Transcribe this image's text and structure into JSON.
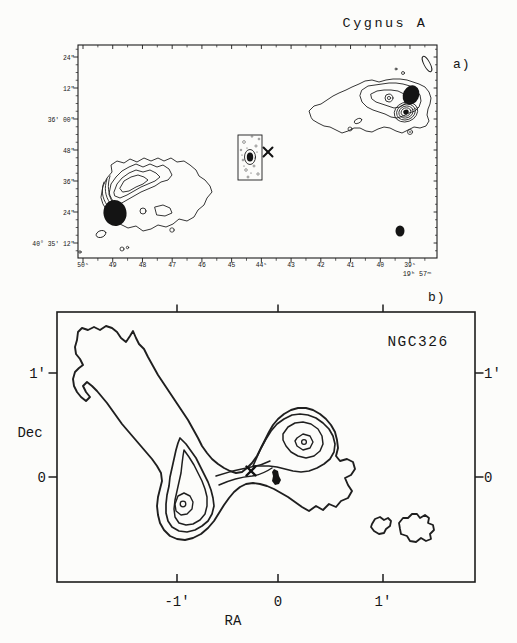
{
  "panel_a": {
    "label": "a)",
    "title": "Cygnus A",
    "dec_tick_labels": [
      "24\"",
      "12\"",
      "36' 00\"",
      "48\"",
      "36\"",
      "24\"",
      "40° 35' 12\""
    ],
    "ra_tick_labels": [
      "50ˢ",
      "49",
      "48",
      "47",
      "46",
      "45",
      "44ˢ",
      "43",
      "42",
      "41",
      "40",
      "39ˢ"
    ],
    "ra_axis_corner_label": "19ʰ 57ᵐ"
  },
  "panel_b": {
    "label": "b)",
    "title": "NGC326",
    "dec_axis_title": "Dec",
    "ra_axis_title": "RA",
    "left_tick_labels": [
      "1'",
      "0"
    ],
    "right_tick_labels": [
      "1'",
      "0"
    ],
    "bottom_tick_labels": [
      "-1'",
      "0",
      "1'"
    ]
  },
  "chart_data": [
    {
      "type": "contour",
      "panel": "a",
      "title": "Cygnus A",
      "x_axis": {
        "label": "19ʰ 57ᵐ (RA)",
        "ticks": [
          "50ˢ",
          "49",
          "48",
          "47",
          "46",
          "45",
          "44ˢ",
          "43",
          "42",
          "41",
          "40",
          "39ˢ"
        ],
        "direction": "RA increases to the left"
      },
      "y_axis": {
        "label": "Declination",
        "ticks": [
          "24\"",
          "12\"",
          "36' 00\"",
          "48\"",
          "36\"",
          "24\"",
          "40° 35' 12\""
        ]
      },
      "features": [
        "east radio lobe with filled hotspot and nested contours",
        "west radio lobe with filled hotspot and concentric secondary hotspot rings",
        "central core inside small rectangular inset with speckle noise",
        "X marker beside inset",
        "small filled beam ellipse at lower right"
      ]
    },
    {
      "type": "contour",
      "panel": "b",
      "title": "NGC326",
      "x_axis": {
        "label": "RA",
        "ticks": [
          "-1'",
          "0",
          "1'"
        ],
        "range_arcmin": [
          -2,
          2
        ]
      },
      "y_axis": {
        "label": "Dec",
        "ticks": [
          "1'",
          "0"
        ],
        "range_arcmin": [
          -1.5,
          1.5
        ]
      },
      "features": [
        "Z-shaped (inversion-symmetric) radio source outer contour with NE plume",
        "southeast lobe with 4 nested contour levels and peak near (-1', -0.3')",
        "northwest lobe with 4 nested contour levels and peak near (0.25', 0.25')",
        "filled radio core near (0,0) with X marker to its west",
        "two detached contour blobs at southwest"
      ]
    }
  ]
}
